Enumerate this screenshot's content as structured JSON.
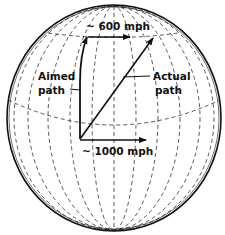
{
  "diagram": {
    "labels": {
      "top_speed": "~ 600 mph",
      "bottom_speed": "~ 1000 mph",
      "aimed_line1": "Aimed",
      "aimed_line2": "path",
      "actual_line1": "Actual",
      "actual_line2": "path"
    },
    "colors": {
      "line": "#111111",
      "background": "#ffffff"
    }
  }
}
